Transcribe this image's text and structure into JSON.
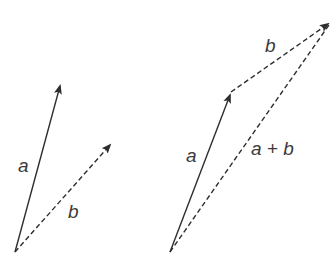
{
  "diagram": {
    "colors": {
      "stroke": "#2e2e2e",
      "text": "#3a3a3a",
      "background": "#ffffff"
    },
    "left_panel": {
      "vectors": [
        {
          "id": "a",
          "label": "a",
          "style": "solid",
          "from": [
            15,
            252
          ],
          "to": [
            61,
            82
          ]
        },
        {
          "id": "b",
          "label": "b",
          "style": "dashed",
          "from": [
            15,
            252
          ],
          "to": [
            113,
            142
          ]
        }
      ],
      "labels": {
        "a": "a",
        "b": "b"
      }
    },
    "right_panel": {
      "vectors": [
        {
          "id": "a",
          "label": "a",
          "style": "solid",
          "from": [
            170,
            252
          ],
          "to": [
            231,
            92
          ]
        },
        {
          "id": "b",
          "label": "b",
          "style": "dashed",
          "from": [
            231,
            92
          ],
          "to": [
            331,
            22
          ]
        },
        {
          "id": "a_plus_b",
          "label": "a + b",
          "style": "dashed",
          "from": [
            170,
            252
          ],
          "to": [
            331,
            22
          ]
        }
      ],
      "labels": {
        "a": "a",
        "b": "b",
        "sum": "a + b"
      }
    }
  }
}
